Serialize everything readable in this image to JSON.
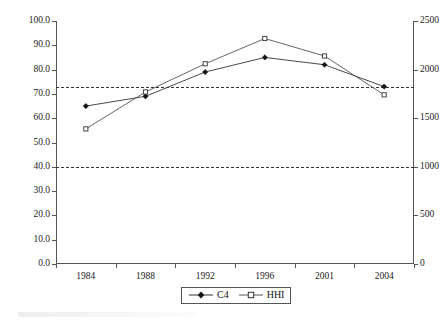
{
  "chart_data": {
    "type": "line",
    "title": "",
    "subtitle": "",
    "xlabel": "",
    "ylabel": "",
    "y2label": "",
    "categories": [
      "1984",
      "1988",
      "1992",
      "1996",
      "2001",
      "2004"
    ],
    "grid": false,
    "legend_position": "bottom-center",
    "axes": {
      "left": {
        "min": 0.0,
        "max": 100.0,
        "step": 10.0,
        "ticks": [
          "0.0",
          "10.0",
          "20.0",
          "30.0",
          "40.0",
          "50.0",
          "60.0",
          "70.0",
          "80.0",
          "90.0",
          "100.0"
        ]
      },
      "right": {
        "min": 0,
        "max": 2500,
        "step": 500,
        "ticks": [
          "0",
          "500",
          "1000",
          "1500",
          "2000",
          "2500"
        ]
      }
    },
    "series": [
      {
        "name": "C4",
        "axis": "left",
        "marker": "filled-diamond",
        "color": "#333333",
        "values": [
          65,
          69,
          79,
          85,
          82,
          73
        ]
      },
      {
        "name": "HHI",
        "axis": "right",
        "marker": "open-square",
        "color": "#555555",
        "values": [
          1390,
          1770,
          2060,
          2320,
          2140,
          1740
        ]
      }
    ],
    "reference_lines": [
      {
        "name": "upper-threshold",
        "left_value": 73,
        "right_value": 1800,
        "style": "dashed"
      },
      {
        "name": "lower-threshold",
        "left_value": 40,
        "right_value": 1000,
        "style": "dashed"
      }
    ]
  },
  "legend": {
    "items": [
      {
        "label": "C4",
        "marker": "filled-diamond"
      },
      {
        "label": "HHI",
        "marker": "open-square"
      }
    ]
  },
  "colors": {
    "axis": "#555555",
    "series_c4": "#333333",
    "series_hhi": "#555555",
    "reference_line": "#333333",
    "background": "#ffffff"
  }
}
